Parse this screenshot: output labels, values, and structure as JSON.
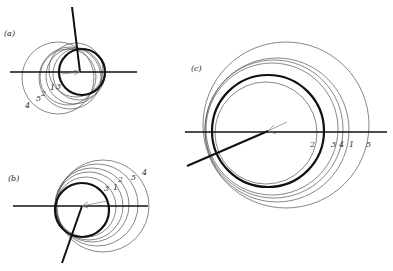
{
  "figure": {
    "panels": [
      {
        "id": "a",
        "label": "(a)",
        "label_pos": [
          4,
          36
        ],
        "axis": {
          "x1": 10,
          "y1": 72,
          "x2": 137,
          "y2": 72
        },
        "ray": {
          "x1": 72,
          "y1": 7,
          "x2": 80,
          "y2": 72
        },
        "pointer": {
          "x1": 62,
          "y1": 74,
          "x2": 80,
          "y2": 72
        },
        "bold_circle": {
          "cx": 82,
          "cy": 72,
          "r": 23
        },
        "circles": [
          {
            "n": "1",
            "cx": 74,
            "cy": 76,
            "r": 28
          },
          {
            "n": "2",
            "cx": 70,
            "cy": 78,
            "r": 31
          },
          {
            "n": "3",
            "cx": 79,
            "cy": 74,
            "r": 26
          },
          {
            "n": "4",
            "cx": 58,
            "cy": 78,
            "r": 36
          },
          {
            "n": "5",
            "cx": 68,
            "cy": 77,
            "r": 28
          }
        ],
        "number_labels": [
          {
            "text": "4",
            "x": 25,
            "y": 108
          },
          {
            "text": "5",
            "x": 37,
            "y": 101
          },
          {
            "text": "2",
            "x": 42,
            "y": 96
          },
          {
            "text": "1",
            "x": 50,
            "y": 90
          },
          {
            "text": "3",
            "x": 56,
            "y": 89
          }
        ]
      },
      {
        "id": "b",
        "label": "(b)",
        "label_pos": [
          8,
          181
        ],
        "axis": {
          "x1": 13,
          "y1": 206,
          "x2": 148,
          "y2": 206
        },
        "ray": {
          "x1": 62,
          "y1": 263,
          "x2": 82,
          "y2": 206
        },
        "pointer": {
          "x1": 82,
          "y1": 206,
          "x2": 107,
          "y2": 201
        },
        "bold_circle": {
          "cx": 82,
          "cy": 210,
          "r": 27
        },
        "circles": [
          {
            "n": "1",
            "cx": 89,
            "cy": 206,
            "r": 34
          },
          {
            "n": "2",
            "cx": 92,
            "cy": 205,
            "r": 37
          },
          {
            "n": "3",
            "cx": 86,
            "cy": 207,
            "r": 30
          },
          {
            "n": "4",
            "cx": 103,
            "cy": 206,
            "r": 46
          },
          {
            "n": "5",
            "cx": 97,
            "cy": 205,
            "r": 41
          }
        ],
        "number_labels": [
          {
            "text": "3",
            "x": 104,
            "y": 191
          },
          {
            "text": "1",
            "x": 114,
            "y": 190
          },
          {
            "text": "2",
            "x": 118,
            "y": 182
          },
          {
            "text": "5",
            "x": 131,
            "y": 180
          },
          {
            "text": "4",
            "x": 142,
            "y": 175
          }
        ]
      },
      {
        "id": "c",
        "label": "(c)",
        "label_pos": [
          191,
          71
        ],
        "axis": {
          "x1": 185,
          "y1": 132,
          "x2": 387,
          "y2": 132
        },
        "ray": {
          "x1": 187,
          "y1": 166,
          "x2": 268,
          "y2": 131
        },
        "pointer": {
          "x1": 268,
          "y1": 131,
          "x2": 287,
          "y2": 122
        },
        "bold_circle": {
          "cx": 268,
          "cy": 131,
          "r": 56
        },
        "circles": [
          {
            "n": "1",
            "cx": 277,
            "cy": 130,
            "r": 72
          },
          {
            "n": "2",
            "cx": 266,
            "cy": 133,
            "r": 51
          },
          {
            "n": "3",
            "cx": 272,
            "cy": 129,
            "r": 66
          },
          {
            "n": "4",
            "cx": 274,
            "cy": 129,
            "r": 69
          },
          {
            "n": "5",
            "cx": 286,
            "cy": 125,
            "r": 83
          }
        ],
        "number_labels": [
          {
            "text": "2",
            "x": 310,
            "y": 147
          },
          {
            "text": "3",
            "x": 331,
            "y": 147
          },
          {
            "text": "4",
            "x": 339,
            "y": 147
          },
          {
            "text": "1",
            "x": 349,
            "y": 147
          },
          {
            "text": "5",
            "x": 366,
            "y": 147
          }
        ]
      }
    ],
    "labels": {
      "a": "(a)",
      "b": "(b)",
      "c": "(c)",
      "a_nums": [
        "4",
        "5",
        "2",
        "1",
        "3"
      ],
      "b_nums": [
        "3",
        "1",
        "2",
        "5",
        "4"
      ],
      "c_nums": [
        "2",
        "3",
        "4",
        "1",
        "5"
      ]
    }
  }
}
